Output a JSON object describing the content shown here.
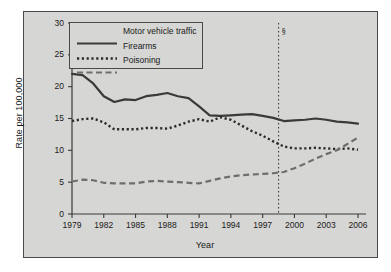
{
  "chart_data": {
    "type": "line",
    "title": "",
    "xlabel": "Year",
    "ylabel": "Rate per 100,000",
    "xlim": [
      1979,
      2006
    ],
    "ylim": [
      0,
      30
    ],
    "ytick_values": [
      0,
      5,
      10,
      15,
      20,
      25,
      30
    ],
    "ytick_labels": [
      "0",
      "5",
      "10",
      "15",
      "20",
      "25",
      "30"
    ],
    "xtick_values": [
      1979,
      1982,
      1985,
      1988,
      1991,
      1994,
      1997,
      2000,
      2003,
      2006
    ],
    "xtick_labels": [
      "1979",
      "1982",
      "1985",
      "1988",
      "1991",
      "1994",
      "1997",
      "2000",
      "2003",
      "2006"
    ],
    "grid": false,
    "legend_position": "upper-left",
    "x": [
      1979,
      1980,
      1981,
      1982,
      1983,
      1984,
      1985,
      1986,
      1987,
      1988,
      1989,
      1990,
      1991,
      1992,
      1993,
      1994,
      1995,
      1996,
      1997,
      1998,
      1999,
      2000,
      2001,
      2002,
      2003,
      2004,
      2005,
      2006
    ],
    "series": [
      {
        "name": "Motor vehicle traffic",
        "style": "solid",
        "color": "#3a3a3a",
        "values": [
          22.0,
          21.8,
          20.5,
          18.5,
          17.6,
          18.0,
          17.9,
          18.5,
          18.7,
          19.0,
          18.5,
          18.2,
          16.9,
          15.5,
          15.4,
          15.5,
          15.6,
          15.7,
          15.4,
          15.1,
          14.6,
          14.7,
          14.8,
          15.0,
          14.8,
          14.5,
          14.4,
          14.2
        ]
      },
      {
        "name": "Firearms",
        "style": "dotted",
        "color": "#2b2b2b",
        "values": [
          14.6,
          14.9,
          15.0,
          14.4,
          13.3,
          13.3,
          13.3,
          13.5,
          13.5,
          13.4,
          13.9,
          14.5,
          14.9,
          14.5,
          15.2,
          14.8,
          13.9,
          13.0,
          12.3,
          11.4,
          10.6,
          10.3,
          10.3,
          10.4,
          10.3,
          10.2,
          10.3,
          10.1
        ]
      },
      {
        "name": "Poisoning",
        "style": "dashed",
        "color": "#6e6e6e",
        "values": [
          5.1,
          5.4,
          5.3,
          4.9,
          4.8,
          4.8,
          4.8,
          5.1,
          5.2,
          5.1,
          5.0,
          4.9,
          4.8,
          5.2,
          5.6,
          5.9,
          6.1,
          6.2,
          6.3,
          6.4,
          6.6,
          7.2,
          7.9,
          8.7,
          9.4,
          10.0,
          11.0,
          12.0
        ]
      }
    ],
    "annotations": [
      {
        "name": "section-marker",
        "symbol": "§",
        "x": 1998.5,
        "line_style": "dotted",
        "description": "vertical dotted reference line"
      }
    ]
  }
}
